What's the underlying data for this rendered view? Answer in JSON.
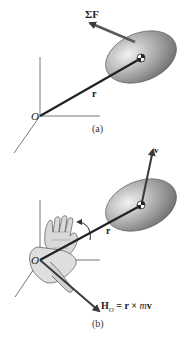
{
  "figure_a": {
    "force_label": "ΣF",
    "position_label": "r",
    "origin_label": "O",
    "caption": "(a)"
  },
  "figure_b": {
    "velocity_label": "v",
    "position_label": "r",
    "origin_label": "O",
    "momentum_label_H": "H",
    "momentum_label_sub": "O",
    "momentum_label_rest": " = r × ",
    "momentum_label_m": "m",
    "momentum_label_v": "v",
    "caption": "(b)"
  },
  "colors": {
    "vector": "#2a2a2a",
    "axis": "#555555",
    "body_dark": "#6e6e6e",
    "body_light": "#dcdcdc",
    "hand_fill": "#d8d8d8",
    "hand_outline": "#555555"
  }
}
